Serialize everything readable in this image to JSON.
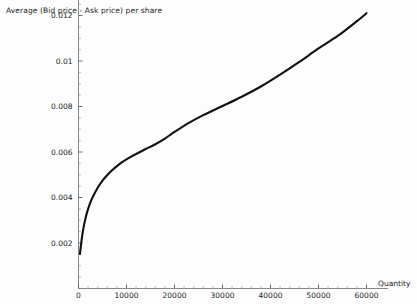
{
  "chart_data": {
    "type": "line",
    "title": "Average (Bid price - Ask price) per share",
    "xlabel": "Quantity",
    "ylabel": "",
    "xlim": [
      0,
      62000
    ],
    "ylim": [
      0,
      0.0128
    ],
    "grid": false,
    "legend": null,
    "x_ticks": [
      0,
      10000,
      20000,
      30000,
      40000,
      50000,
      60000
    ],
    "x_tick_labels": [
      "0",
      "10000",
      "20000",
      "30000",
      "40000",
      "50000",
      "60000"
    ],
    "y_ticks": [
      0.002,
      0.004,
      0.006,
      0.008,
      0.01,
      0.012
    ],
    "y_tick_labels": [
      "0.002",
      "0.004",
      "0.006",
      "0.008",
      "0.01",
      "0.012"
    ],
    "x_minor_step": 2000,
    "y_minor_step": 0.0005,
    "series": [
      {
        "name": "Average spread per share",
        "color": "#111111",
        "x": [
          300,
          600,
          1000,
          1500,
          2000,
          2600,
          3200,
          4000,
          5000,
          6000,
          7000,
          8000,
          9000,
          10000,
          11000,
          12000,
          13000,
          14000,
          16000,
          18000,
          20000,
          23000,
          26000,
          30000,
          34000,
          38000,
          42000,
          46000,
          50000,
          54000,
          58000,
          60000
        ],
        "y": [
          0.00152,
          0.00205,
          0.00262,
          0.00312,
          0.0035,
          0.00385,
          0.00412,
          0.00443,
          0.00474,
          0.00499,
          0.0052,
          0.00538,
          0.00554,
          0.00568,
          0.0058,
          0.00591,
          0.00602,
          0.00613,
          0.00634,
          0.00659,
          0.00688,
          0.00728,
          0.00762,
          0.00802,
          0.00843,
          0.00888,
          0.0094,
          0.00996,
          0.01055,
          0.0111,
          0.01175,
          0.0121
        ]
      }
    ]
  },
  "axis_labels": {
    "x_name": "Quantity"
  }
}
